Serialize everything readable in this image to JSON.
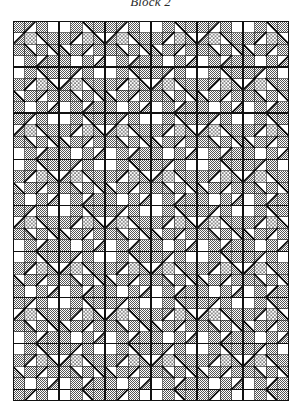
{
  "page": {
    "title": "Block 2",
    "background_color": "#ffffff"
  },
  "figure": {
    "caption": "Block 2",
    "type": "quilt-block-diagram"
  },
  "palette": {
    "white": "#ffffff",
    "gray_stipple": "#9a9a9a",
    "dot_print": "#ffffff",
    "dot_color": "#1a1a1a",
    "line": "#111111",
    "heavy_line": "#000000"
  },
  "grid": {
    "columns": 24,
    "rows": 33,
    "cell_px": 11.5,
    "origin_x": 13,
    "origin_y": 21,
    "width_px": 276,
    "height_px": 380,
    "block_size_cells": 4,
    "blocks_across": 6,
    "blocks_down": 8.25
  },
  "legend": {
    "fabrics": [
      {
        "name": "plain",
        "label": "white",
        "fill": "#ffffff"
      },
      {
        "name": "stipple",
        "label": "gray stipple",
        "fill": "#9a9a9a"
      },
      {
        "name": "dotted",
        "label": "dotted print",
        "fill": "#ffffff"
      }
    ]
  },
  "chart_data": {
    "type": "heatmap",
    "title": "Block 2",
    "xlabel": "",
    "ylabel": "",
    "categories": [],
    "values": [],
    "block_unit": {
      "size": 4,
      "cells": [
        {
          "r": 0,
          "c": 0,
          "fill": "stipple",
          "tri": null
        },
        {
          "r": 0,
          "c": 1,
          "fill": "white",
          "tri": "tl-stipple"
        },
        {
          "r": 0,
          "c": 2,
          "fill": "stipple",
          "tri": null
        },
        {
          "r": 0,
          "c": 3,
          "fill": "white",
          "tri": null
        },
        {
          "r": 1,
          "c": 0,
          "fill": "white",
          "tri": "br-stipple"
        },
        {
          "r": 1,
          "c": 1,
          "fill": "dotted",
          "tri": null
        },
        {
          "r": 1,
          "c": 2,
          "fill": "white",
          "tri": "tr-stipple"
        },
        {
          "r": 1,
          "c": 3,
          "fill": "stipple",
          "tri": null
        },
        {
          "r": 2,
          "c": 0,
          "fill": "stipple",
          "tri": null
        },
        {
          "r": 2,
          "c": 1,
          "fill": "white",
          "tri": "bl-stipple"
        },
        {
          "r": 2,
          "c": 2,
          "fill": "stipple",
          "tri": null
        },
        {
          "r": 2,
          "c": 3,
          "fill": "white",
          "tri": "tr-stipple"
        },
        {
          "r": 3,
          "c": 0,
          "fill": "white",
          "tri": null
        },
        {
          "r": 3,
          "c": 1,
          "fill": "stipple",
          "tri": null
        },
        {
          "r": 3,
          "c": 2,
          "fill": "white",
          "tri": "br-stipple"
        },
        {
          "r": 3,
          "c": 3,
          "fill": "stipple",
          "tri": null
        }
      ]
    }
  }
}
